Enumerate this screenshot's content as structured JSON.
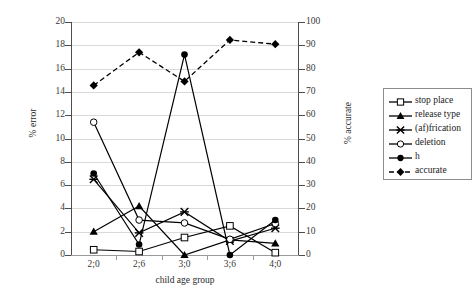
{
  "chart_data": {
    "type": "line",
    "title": "",
    "xlabel": "child age group",
    "ylabel": "% error",
    "y2label": "% accurate",
    "categories": [
      "2;0",
      "2;6",
      "3;0",
      "3;6",
      "4;0"
    ],
    "ylim": [
      0,
      20
    ],
    "yticks": [
      0,
      2,
      4,
      6,
      8,
      10,
      12,
      14,
      16,
      18,
      20
    ],
    "y2lim": [
      0,
      100
    ],
    "y2ticks": [
      0,
      10,
      20,
      30,
      40,
      50,
      60,
      70,
      80,
      90,
      100
    ],
    "grid": true,
    "legend_position": "right",
    "series": [
      {
        "name": "stop place",
        "axis": "left",
        "marker": "open-square",
        "line": "solid",
        "values": [
          0.45,
          0.3,
          1.5,
          2.5,
          0.2
        ]
      },
      {
        "name": "release type",
        "axis": "left",
        "marker": "filled-triangle",
        "line": "solid",
        "values": [
          2.0,
          4.2,
          0.0,
          1.3,
          1.0
        ]
      },
      {
        "name": "(af)frication",
        "axis": "left",
        "marker": "cross-x",
        "line": "solid",
        "values": [
          6.5,
          1.9,
          3.7,
          1.2,
          2.3
        ]
      },
      {
        "name": "deletion",
        "axis": "left",
        "marker": "open-circle",
        "line": "solid",
        "values": [
          11.4,
          3.0,
          2.75,
          1.35,
          2.7
        ]
      },
      {
        "name": "h",
        "axis": "left",
        "marker": "filled-circle",
        "line": "solid",
        "values": [
          7.0,
          0.9,
          17.2,
          0.0,
          3.0
        ]
      },
      {
        "name": "accurate",
        "axis": "right",
        "marker": "filled-diamond",
        "line": "dashed",
        "values": [
          72.8,
          87.0,
          74.5,
          92.3,
          90.5
        ]
      }
    ]
  },
  "legend": {
    "items": [
      {
        "label": "stop place"
      },
      {
        "label": "release type"
      },
      {
        "label": "(af)frication"
      },
      {
        "label": "deletion"
      },
      {
        "label": "h"
      },
      {
        "label": "accurate"
      }
    ]
  }
}
